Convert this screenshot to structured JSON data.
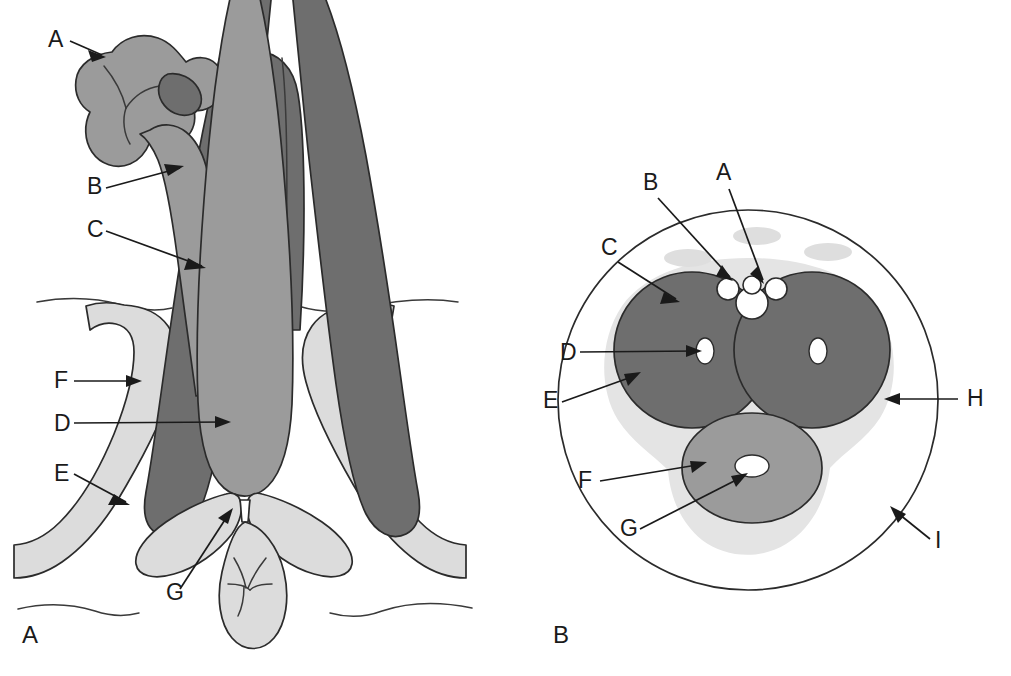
{
  "figure": {
    "background_color": "#ffffff"
  },
  "palette": {
    "dark_gray": "#6e6e6e",
    "medium_gray": "#9b9b9b",
    "light_gray": "#cfcfcf",
    "pale_gray": "#e2e2e2",
    "very_pale_gray": "#ededed",
    "white": "#ffffff",
    "outline": "#2b2b2b",
    "text": "#1a1a1a"
  },
  "panels": [
    {
      "id": "panel-a",
      "panel_label": "A",
      "panel_label_position": {
        "x": 22,
        "y": 643
      },
      "description": "Frontal / coronal view of penis, crura, bulb and perineum",
      "callouts": [
        {
          "letter": "A",
          "label_x": 48,
          "label_y": 47,
          "tip_x": 106,
          "tip_y": 57,
          "target": "glans"
        },
        {
          "letter": "B",
          "label_x": 87,
          "label_y": 194,
          "tip_x": 184,
          "tip_y": 166,
          "target": "corpus-spongiosum-shaft"
        },
        {
          "letter": "C",
          "label_x": 87,
          "label_y": 237,
          "tip_x": 206,
          "tip_y": 268,
          "target": "corpus-cavernosum-shaft"
        },
        {
          "letter": "F",
          "label_x": 54,
          "label_y": 388,
          "tip_x": 142,
          "tip_y": 381,
          "target": "ischiocavernosus-muscle"
        },
        {
          "letter": "D",
          "label_x": 54,
          "label_y": 431,
          "tip_x": 231,
          "tip_y": 422,
          "target": "bulb-of-penis"
        },
        {
          "letter": "E",
          "label_x": 54,
          "label_y": 481,
          "tip_x": 130,
          "tip_y": 505,
          "target": "crus-of-penis"
        },
        {
          "letter": "G",
          "label_x": 166,
          "label_y": 600,
          "tip_x": 233,
          "tip_y": 508,
          "target": "perineal-body"
        }
      ]
    },
    {
      "id": "panel-b",
      "panel_label": "B",
      "panel_label_position": {
        "x": 553,
        "y": 643
      },
      "description": "Transverse cross-section through the shaft of the penis",
      "callouts": [
        {
          "letter": "B",
          "label_x": 643,
          "label_y": 190,
          "tip_x": 733,
          "tip_y": 281,
          "target": "dorsal-artery"
        },
        {
          "letter": "A",
          "label_x": 716,
          "label_y": 180,
          "tip_x": 764,
          "tip_y": 284,
          "target": "deep-dorsal-vein"
        },
        {
          "letter": "C",
          "label_x": 601,
          "label_y": 255,
          "tip_x": 680,
          "tip_y": 302,
          "target": "corpus-cavernosum"
        },
        {
          "letter": "D",
          "label_x": 560,
          "label_y": 360,
          "tip_x": 702,
          "tip_y": 351,
          "target": "deep-artery-of-penis"
        },
        {
          "letter": "E",
          "label_x": 543,
          "label_y": 408,
          "tip_x": 641,
          "tip_y": 372,
          "target": "tunica-albuginea"
        },
        {
          "letter": "F",
          "label_x": 578,
          "label_y": 488,
          "tip_x": 707,
          "tip_y": 462,
          "target": "corpus-spongiosum"
        },
        {
          "letter": "G",
          "label_x": 620,
          "label_y": 536,
          "tip_x": 748,
          "tip_y": 473,
          "target": "urethra"
        },
        {
          "letter": "H",
          "label_x": 967,
          "label_y": 406,
          "tip_x": 884,
          "tip_y": 399,
          "target": "buck-fascia"
        },
        {
          "letter": "I",
          "label_x": 935,
          "label_y": 548,
          "tip_x": 890,
          "tip_y": 506,
          "target": "skin"
        }
      ]
    }
  ]
}
